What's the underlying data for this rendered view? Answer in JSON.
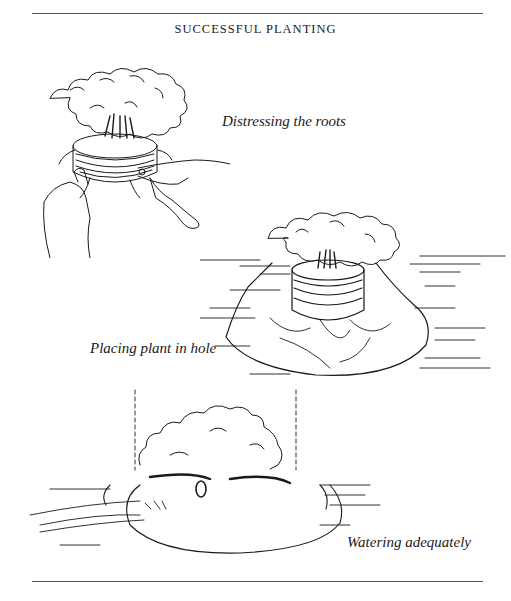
{
  "page": {
    "title": "SUCCESSFUL PLANTING"
  },
  "illustrations": [
    {
      "id": "distressing-roots",
      "caption": "Distressing the roots",
      "icon": "tree-rootball-hands-icon"
    },
    {
      "id": "placing-plant",
      "caption": "Placing plant in hole",
      "icon": "tree-in-hole-icon"
    },
    {
      "id": "watering",
      "caption": "Watering adequately",
      "icon": "tree-watering-hose-icon"
    }
  ]
}
